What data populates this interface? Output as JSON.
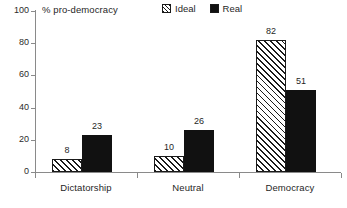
{
  "chart_data": {
    "type": "bar",
    "title": "% pro-democracy",
    "xlabel": "",
    "ylabel": "",
    "ylim": [
      0,
      100
    ],
    "yticks": [
      0,
      20,
      40,
      60,
      80,
      100
    ],
    "ytick_labels": [
      "0",
      "20",
      "40",
      "60",
      "80",
      "100"
    ],
    "grid": false,
    "legend_position": "top-center",
    "categories": [
      "Dictatorship",
      "Neutral",
      "Democracy"
    ],
    "series": [
      {
        "name": "Ideal",
        "values": [
          8,
          10,
          82
        ],
        "value_labels": [
          "8",
          "10",
          "82"
        ],
        "fill": "diagonal-hatch",
        "color": "#1a1a1a"
      },
      {
        "name": "Real",
        "values": [
          23,
          26,
          51
        ],
        "value_labels": [
          "23",
          "26",
          "51"
        ],
        "fill": "solid",
        "color": "#111111"
      }
    ],
    "axis_color": "#8a8a8a",
    "text_color": "#1f1f1f"
  }
}
